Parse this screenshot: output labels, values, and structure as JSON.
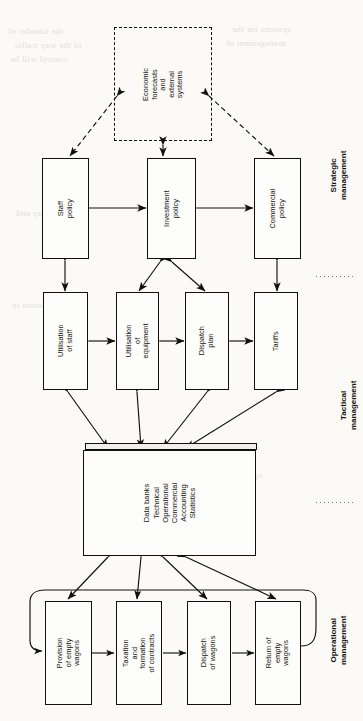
{
  "figure": {
    "orientation": "rotated-90-ccw",
    "background_color": "#fbfaf7",
    "ink_color": "#11100e"
  },
  "bleed_text": [
    "the transfer of",
    "of the way traffic",
    "control will be",
    "systems for the",
    "management of",
    "the railway and",
    "information in",
    "operational data"
  ],
  "nodes": {
    "external": {
      "label": "Economic\nforecasts\nand\nexternal\nsystems",
      "style": "dashed"
    },
    "staff_policy": {
      "label": "Staff\npolicy"
    },
    "investment_policy": {
      "label": "Investment\npolicy"
    },
    "commercial_policy": {
      "label": "Commercial\npolicy"
    },
    "utilisation_staff": {
      "label": "Utilisation\nof staff"
    },
    "utilisation_equipment": {
      "label": "Utilisation\nof equipment"
    },
    "dispatch_plan": {
      "label": "Dispatch\nplan"
    },
    "tariffs": {
      "label": "Tariffs"
    },
    "data_banks": {
      "label": "Data banks\nTechnical\nOperational\nCommercial\nAccounting\nStatistics"
    },
    "provision_empty_wagons": {
      "label": "Provision\nof empty\nwagons"
    },
    "taxation_contracts": {
      "label": "Taxation\nand formation\nof contracts"
    },
    "dispatch_wagons": {
      "label": "Dispatch\nof wagons"
    },
    "return_empty_wagons": {
      "label": "Return of\nempty wagons"
    }
  },
  "bands": [
    {
      "id": "strategic",
      "label": "Strategic\nmanagement"
    },
    {
      "id": "tactical",
      "label": "Tactical management"
    },
    {
      "id": "operational",
      "label": "Operational\nmanagement"
    }
  ]
}
